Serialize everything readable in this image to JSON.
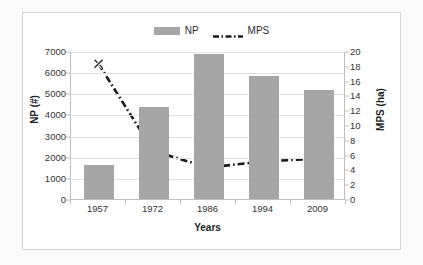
{
  "chart_data": {
    "type": "bar",
    "title": "",
    "subtitle": "",
    "xlabel": "Years",
    "ylabel": "NP (#)",
    "y2label": "MPS (ha)",
    "categories": [
      "1957",
      "1972",
      "1986",
      "1994",
      "2009"
    ],
    "series": [
      {
        "name": "NP",
        "type": "bar",
        "axis": "left",
        "color": "#a6a6a6",
        "values": [
          1600,
          4350,
          6850,
          5800,
          5150
        ]
      },
      {
        "name": "MPS",
        "type": "line",
        "axis": "right",
        "color": "#1a1a1a",
        "marker": "x",
        "linestyle": "dash-dot",
        "values": [
          18.4,
          6.6,
          4.4,
          5.2,
          5.6
        ]
      }
    ],
    "ylim": [
      0,
      7000
    ],
    "yticks": [
      "0",
      "1000",
      "2000",
      "3000",
      "4000",
      "5000",
      "6000",
      "7000"
    ],
    "y2lim": [
      0,
      20
    ],
    "y2ticks": [
      "0",
      "2",
      "4",
      "6",
      "8",
      "10",
      "12",
      "14",
      "16",
      "18",
      "20"
    ],
    "grid": true,
    "grid_axis": "y",
    "legend": [
      "NP",
      "MPS"
    ],
    "legend_position": "top-center"
  },
  "legend": {
    "np_label": "NP",
    "mps_label": "MPS"
  },
  "axes": {
    "x_title": "Years",
    "y_left_title": "NP (#)",
    "y_right_title": "MPS (ha)"
  }
}
